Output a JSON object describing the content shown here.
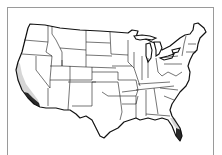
{
  "map": {
    "type": "choropleth",
    "region": "Contiguous United States",
    "shading": [
      {
        "area": "Southern California coast",
        "level": "dark"
      },
      {
        "area": "Central/Southern California coast",
        "level": "light"
      },
      {
        "area": "South Florida tip",
        "level": "dark"
      },
      {
        "area": "Central Florida peninsula",
        "level": "light"
      }
    ],
    "colors": {
      "border": "#9a9a9a",
      "outline": "#111111",
      "fill": "#ffffff",
      "shade_light": "#d6d6d6",
      "shade_dark": "#2a2a2a"
    }
  }
}
